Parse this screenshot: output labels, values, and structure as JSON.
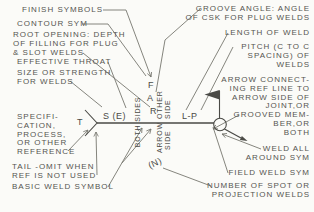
{
  "colors": {
    "background": "#fbfbf8",
    "ink": "#4a4a46",
    "leader": "#77776f"
  },
  "left_labels": [
    {
      "name": "finish-symbols",
      "lines": [
        "FINISH SYMBOLS"
      ]
    },
    {
      "name": "contour-sym",
      "lines": [
        "CONTOUR SYM"
      ]
    },
    {
      "name": "root-opening",
      "lines": [
        "ROOT OPENING: DEPTH",
        "OF FILLING FOR PLUG",
        "& SLOT WELDS"
      ]
    },
    {
      "name": "effective-throat",
      "lines": [
        "EFFECTIVE THROAT"
      ]
    },
    {
      "name": "size-or-strength",
      "lines": [
        "SIZE OR STRENGTH",
        "FOR WELDS"
      ]
    },
    {
      "name": "specification",
      "lines": [
        "SPECIFI-",
        "CATION,",
        "PROCESS,",
        "OR OTHER",
        "REFERENCE"
      ]
    },
    {
      "name": "tail-omit",
      "lines": [
        "TAIL -OMIT WHEN",
        "REF IS NOT USED"
      ]
    },
    {
      "name": "basic-weld-symbol",
      "lines": [
        "BASIC WELD SYMBOL"
      ]
    }
  ],
  "right_labels": [
    {
      "name": "groove-angle",
      "lines": [
        "GROOVE ANGLE: ANGLE",
        "OF CSK FOR PLUG WELDS"
      ]
    },
    {
      "name": "length-of-weld",
      "lines": [
        "LENGTH OF WELD"
      ]
    },
    {
      "name": "pitch",
      "lines": [
        "PITCH (C TO C",
        "SPACING) OF",
        "WELDS"
      ]
    },
    {
      "name": "arrow-connecting",
      "lines": [
        "ARROW CONNECT-",
        "ING REF LINE TO",
        "ARROW SIDE OF",
        "JOINT,OR",
        "GROOVED MEM-",
        "BER,OR",
        "BOTH"
      ]
    },
    {
      "name": "weld-all-around",
      "lines": [
        "WELD ALL",
        "AROUND SYM"
      ]
    },
    {
      "name": "field-weld-sym",
      "lines": [
        "FIELD WELD SYM"
      ]
    },
    {
      "name": "number-of-spot",
      "lines": [
        "NUMBER OF SPOT OR",
        "PROJECTION WELDS"
      ]
    }
  ],
  "symbol": {
    "tail_letter": "T",
    "size_strength_field": "S (E)",
    "finish_field": "F",
    "groove_angle_field": "A",
    "root_opening_field": "R",
    "length_pitch_field": "L-P",
    "number_field": "(N)",
    "both_sides_label": "BOTH SIDES",
    "other_side_label_line1": "OTHER",
    "other_side_label_line2": "SIDE",
    "arrow_side_label_line1": "ARROW",
    "arrow_side_label_line2": "SIDE"
  }
}
